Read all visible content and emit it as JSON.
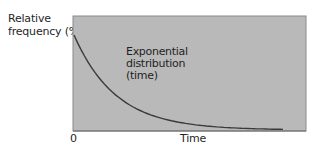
{
  "chart_data": {
    "type": "line",
    "title": "",
    "xlabel": "Time",
    "ylabel": "Relative frequency (%)",
    "x_ticks": [
      "0"
    ],
    "annotation": [
      "Exponential",
      "distribution",
      "(time)"
    ],
    "grid": false,
    "legend": null,
    "background_color": "#b9b9b9",
    "line_color": "#3a3a3a",
    "series": [
      {
        "name": "Exponential distribution (time)",
        "x": [
          0,
          0.1,
          0.2,
          0.3,
          0.4,
          0.5,
          0.6,
          0.7,
          0.8,
          0.9
        ],
        "values": [
          1.0,
          0.61,
          0.37,
          0.22,
          0.14,
          0.08,
          0.05,
          0.03,
          0.02,
          0.01
        ]
      }
    ],
    "xlim": [
      0,
      1
    ],
    "ylim": [
      0,
      1.2
    ]
  },
  "labels": {
    "ylabel_line1": "Relative",
    "ylabel_line2": "frequency (%)",
    "annot_line1": "Exponential",
    "annot_line2": "distribution",
    "annot_line3": "(time)",
    "x_origin": "0",
    "xlabel": "Time"
  }
}
